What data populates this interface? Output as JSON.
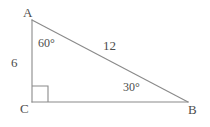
{
  "figure": {
    "type": "right-triangle",
    "background_color": "#ffffff",
    "stroke_color": "#8a8a8a",
    "text_color": "#4d4d4d",
    "vertices": {
      "a": {
        "label": "A",
        "x": 32,
        "y": 20
      },
      "c": {
        "label": "C",
        "x": 32,
        "y": 102
      },
      "b": {
        "label": "B",
        "x": 188,
        "y": 102
      }
    },
    "sides": {
      "ac": {
        "label": "6"
      },
      "ab": {
        "label": "12"
      },
      "cb": {
        "label": ""
      }
    },
    "angles": {
      "at_a": {
        "label": "60°"
      },
      "at_b": {
        "label": "30°"
      },
      "at_c": {
        "label": "",
        "marker": "right-angle-square",
        "size": 16
      }
    }
  }
}
